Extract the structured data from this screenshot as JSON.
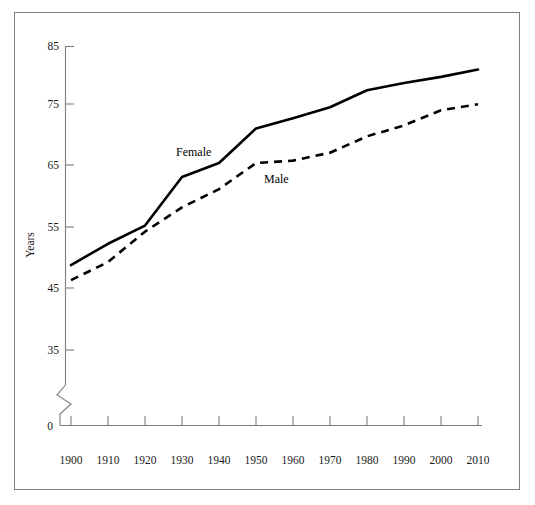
{
  "chart_data": {
    "type": "line",
    "title": "",
    "xlabel": "",
    "ylabel": "Years",
    "x": [
      1900,
      1910,
      1920,
      1930,
      1940,
      1950,
      1960,
      1970,
      1980,
      1990,
      2000,
      2010
    ],
    "xticklabels": [
      "1900",
      "1910",
      "1920",
      "1930",
      "1940",
      "1950",
      "1960",
      "1970",
      "1980",
      "1990",
      "2000",
      "2010"
    ],
    "yticklabels": [
      "0",
      "35",
      "45",
      "55",
      "65",
      "75",
      "85"
    ],
    "ylim": [
      35,
      85
    ],
    "xlim": [
      1900,
      2010
    ],
    "y_axis_break": true,
    "y_axis_break_note": "zigzag break between 0 and 35",
    "grid": false,
    "legend": "inline-labels",
    "series": [
      {
        "name": "Female",
        "style": "solid",
        "label_text": "Female",
        "values": [
          49.0,
          52.5,
          55.5,
          63.5,
          65.8,
          71.5,
          73.2,
          75.0,
          77.8,
          79.0,
          80.0,
          81.2
        ]
      },
      {
        "name": "Male",
        "style": "dashed",
        "label_text": "Male",
        "values": [
          46.5,
          49.5,
          54.5,
          58.5,
          61.5,
          65.8,
          66.2,
          67.5,
          70.2,
          72.0,
          74.5,
          75.5
        ]
      }
    ],
    "annotations": [
      {
        "text": "Female",
        "x_approx": 1922,
        "y_approx": 67.5
      },
      {
        "text": "Male",
        "x_approx": 1942,
        "y_approx": 63.0
      }
    ],
    "colors": {
      "line": "#000000",
      "axis": "#7d7d7d",
      "text": "#1a1a1a",
      "background": "#ffffff",
      "border": "#808080"
    }
  }
}
